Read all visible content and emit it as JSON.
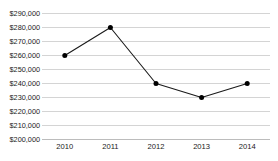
{
  "chart_data": {
    "type": "line",
    "title": "",
    "subtitle": "",
    "xlabel": "",
    "ylabel": "",
    "categories": [
      "2010",
      "2011",
      "2012",
      "2013",
      "2014"
    ],
    "values": [
      260000,
      280000,
      240000,
      230000,
      240000
    ],
    "series": [
      {
        "name": "",
        "values": [
          260000,
          280000,
          240000,
          230000,
          240000
        ]
      }
    ],
    "ylim": [
      200000,
      290000
    ],
    "ytick_step": 10000,
    "ytick_labels": [
      "$290,000",
      "$280,000",
      "$270,000",
      "$260,000",
      "$250,000",
      "$240,000",
      "$230,000",
      "$220,000",
      "$210,000",
      "$200,000"
    ],
    "ytick_values": [
      290000,
      280000,
      270000,
      260000,
      250000,
      240000,
      230000,
      220000,
      210000,
      200000
    ],
    "xtick_labels": [
      "2010",
      "2011",
      "2012",
      "2013",
      "2014"
    ],
    "grid": {
      "horizontal": true,
      "vertical": false
    },
    "legend": {
      "visible": false,
      "position": "none"
    },
    "markers": {
      "shape": "circle",
      "filled": true
    },
    "colors": {
      "line": "#1a1a1a",
      "marker": "#000000",
      "gridline": "#d4d4d4",
      "axis": "#bcbcbc",
      "background": "#ffffff",
      "text": "#1a1a1a"
    }
  }
}
